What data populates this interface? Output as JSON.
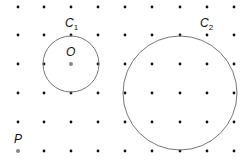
{
  "diagram": {
    "grid": {
      "columns_x": [
        18,
        44,
        71,
        98,
        125,
        152,
        180,
        207,
        234
      ],
      "rows_y": [
        7,
        35,
        64,
        93,
        122,
        151
      ],
      "dot_color": "#111111"
    },
    "circles": [
      {
        "label": "C",
        "subscript": "1",
        "cx": 71,
        "cy": 64,
        "r": 28,
        "color": "#777777"
      },
      {
        "label": "C",
        "subscript": "2",
        "cx": 180,
        "cy": 93,
        "r": 57,
        "color": "#777777"
      }
    ],
    "points": [
      {
        "label": "O",
        "x": 71,
        "y": 64,
        "color": "#888888"
      },
      {
        "label": "P",
        "x": 18,
        "y": 151,
        "color": "#888888"
      }
    ]
  }
}
